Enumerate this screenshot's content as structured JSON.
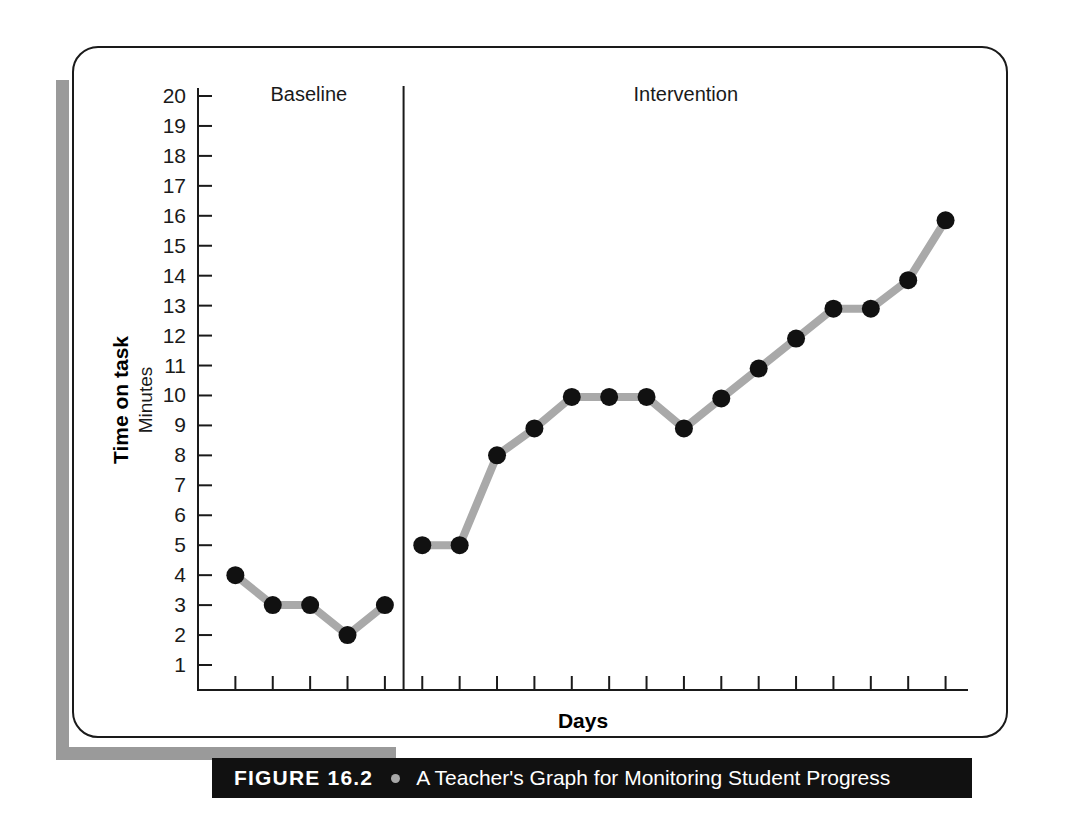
{
  "figure": {
    "caption_number": "FIGURE 16.2",
    "caption_separator_icon": "bullet-dot-icon",
    "caption_title": "A Teacher's Graph for Monitoring Student Progress"
  },
  "chart_data": {
    "type": "line",
    "title": "",
    "xlabel": "Days",
    "ylabel": "Time on task",
    "ylabel_sub": "Minutes",
    "ylim": [
      0,
      20
    ],
    "yticks": [
      1,
      2,
      3,
      4,
      5,
      6,
      7,
      8,
      9,
      10,
      11,
      12,
      13,
      14,
      15,
      16,
      17,
      18,
      19,
      20
    ],
    "ytick_labels": [
      "1",
      "2",
      "3",
      "4",
      "5",
      "6",
      "7",
      "8",
      "9",
      "10",
      "11",
      "12",
      "13",
      "14",
      "15",
      "16",
      "17",
      "18",
      "19",
      "20"
    ],
    "xlim": [
      0.5,
      20.5
    ],
    "x": [
      1,
      2,
      3,
      4,
      5,
      6,
      7,
      8,
      9,
      10,
      11,
      12,
      13,
      14,
      15,
      16,
      17,
      18,
      19,
      20
    ],
    "xtick_labels": [],
    "grid": false,
    "legend": "none",
    "marker": "filled-circle",
    "marker_color": "#111111",
    "line_color": "#a9a9a9",
    "phases": [
      {
        "name": "Baseline",
        "label": "Baseline",
        "x_start": 1,
        "x_end": 5
      },
      {
        "name": "Intervention",
        "label": "Intervention",
        "x_start": 6,
        "x_end": 20
      }
    ],
    "phase_line_x": 5.5,
    "series": [
      {
        "name": "Time on task (minutes)",
        "values": [
          4,
          3,
          3,
          2,
          3,
          5,
          5,
          8,
          8.9,
          9.95,
          9.95,
          9.95,
          8.9,
          9.9,
          10.9,
          11.9,
          12.9,
          12.9,
          13.85,
          15.85
        ]
      }
    ],
    "phase_values": {
      "baseline": [
        4,
        3,
        3,
        2,
        3
      ],
      "intervention": [
        5,
        5,
        8,
        8.9,
        9.95,
        9.95,
        9.95,
        8.9,
        9.9,
        10.9,
        11.9,
        12.9,
        12.9,
        13.85,
        15.85
      ]
    }
  }
}
